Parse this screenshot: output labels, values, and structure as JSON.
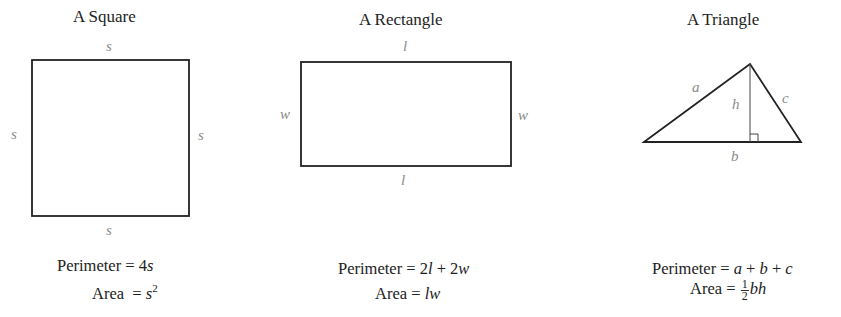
{
  "figures": [
    {
      "title": "A Square",
      "labels": {
        "top": "s",
        "bottom": "s",
        "left": "s",
        "right": "s"
      },
      "perimeter": {
        "prefix": "Perimeter = ",
        "expr": "4s",
        "parts": [
          "4",
          "s"
        ]
      },
      "area": {
        "prefix": "Area  = ",
        "base": "s",
        "exp": "2"
      }
    },
    {
      "title": "A Rectangle",
      "labels": {
        "top": "l",
        "bottom": "l",
        "left": "w",
        "right": "w"
      },
      "perimeter": {
        "prefix": "Perimeter = ",
        "parts": [
          "2",
          "l",
          " + 2",
          "w"
        ]
      },
      "area": {
        "prefix": "Area = ",
        "expr": "lw"
      }
    },
    {
      "title": "A Triangle",
      "labels": {
        "a": "a",
        "b": "b",
        "c": "c",
        "h": "h"
      },
      "perimeter": {
        "prefix": "Perimeter = ",
        "parts": [
          "a",
          " + ",
          "b",
          " + ",
          "c"
        ]
      },
      "area": {
        "prefix": "Area = ",
        "frac_num": "1",
        "frac_den": "2",
        "expr": "bh"
      }
    }
  ],
  "colors": {
    "stroke": "#222222",
    "label": "#8a8a8a",
    "text": "#222222"
  }
}
